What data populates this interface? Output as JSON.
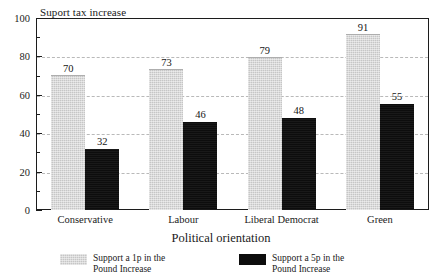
{
  "chart_data": {
    "type": "bar",
    "title": "Suport tax increase",
    "xlabel": "Political orientation",
    "ylabel": "",
    "ylim": [
      0,
      100
    ],
    "ytick_step": 20,
    "yminor_step": 10,
    "grid": "horizontal-dashed",
    "legend_position": "bottom",
    "categories": [
      "Conservative",
      "Labour",
      "Liberal Democrat",
      "Green"
    ],
    "yticks": [
      "0",
      "20",
      "40",
      "60",
      "80",
      "100"
    ],
    "gridline_values": [
      20,
      40,
      60,
      80
    ],
    "series": [
      {
        "name": "Support a 1p in the Pound Increase",
        "name_line1": "Support a 1p in the",
        "name_line2": "Pound Increase",
        "color": "#c6c6c6",
        "values": [
          70,
          73,
          79,
          91
        ],
        "labels": [
          "70",
          "73",
          "79",
          "91"
        ]
      },
      {
        "name": "Support a 5p in the Pound Increase",
        "name_line1": "Support a 5p in the",
        "name_line2": "Pound Increase",
        "color": "#0d0d0d",
        "values": [
          32,
          46,
          48,
          55
        ],
        "labels": [
          "32",
          "46",
          "48",
          "55"
        ]
      }
    ]
  }
}
